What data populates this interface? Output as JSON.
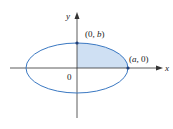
{
  "diagram": {
    "type": "ellipse-quadrant",
    "axes": {
      "x_label": "x",
      "y_label": "y",
      "origin_label": "0"
    },
    "points": [
      {
        "id": "top",
        "label_prefix": "(0, ",
        "label_var": "b",
        "label_suffix": ")"
      },
      {
        "id": "right",
        "label_prefix": "(",
        "label_var": "a",
        "label_suffix": ", 0)"
      }
    ],
    "colors": {
      "ellipse_stroke": "#3a78c2",
      "shaded_fill": "#cfe0f3",
      "axis": "#333333",
      "point": "#1f3f7a"
    },
    "shaded_region": "first quadrant of ellipse"
  }
}
